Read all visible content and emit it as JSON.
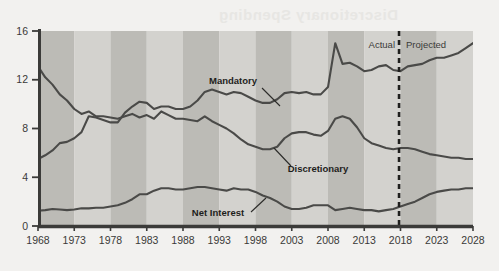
{
  "chart_data": {
    "type": "line",
    "title": "",
    "xlabel": "",
    "ylabel": "",
    "xlim": [
      1968,
      2028
    ],
    "ylim": [
      0,
      16
    ],
    "yticks": [
      0,
      4,
      8,
      12,
      16
    ],
    "xticks": [
      1968,
      1973,
      1978,
      1983,
      1988,
      1993,
      1998,
      2003,
      2008,
      2013,
      2018,
      2023,
      2028
    ],
    "grid": false,
    "legend": "inline-annotations",
    "band_shading": "alternating 5-year vertical bands",
    "annotations": [
      {
        "name": "actual-label",
        "text": "Actual",
        "x": 2014.5,
        "y": 14.6
      },
      {
        "name": "projected-label",
        "text": "Projected",
        "x": 2021.5,
        "y": 14.6
      },
      {
        "name": "divider",
        "text": "",
        "x": 2017.8,
        "style": "dashed-vertical"
      }
    ],
    "series": [
      {
        "name": "Mandatory",
        "label": "Mandatory",
        "label_x": 1993.5,
        "label_y": 12.4,
        "color": "#4a4a48",
        "x": [
          1968,
          1969,
          1970,
          1971,
          1972,
          1973,
          1974,
          1975,
          1976,
          1977,
          1978,
          1979,
          1980,
          1981,
          1982,
          1983,
          1984,
          1985,
          1986,
          1987,
          1988,
          1989,
          1990,
          1991,
          1992,
          1993,
          1994,
          1995,
          1996,
          1997,
          1998,
          1999,
          2000,
          2001,
          2002,
          2003,
          2004,
          2005,
          2006,
          2007,
          2008,
          2009,
          2010,
          2011,
          2012,
          2013,
          2014,
          2015,
          2016,
          2017,
          2018,
          2019,
          2020,
          2021,
          2022,
          2023,
          2024,
          2025,
          2026,
          2027,
          2028
        ],
        "values": [
          5.5,
          5.8,
          6.2,
          6.8,
          6.9,
          7.2,
          7.7,
          9.0,
          8.9,
          8.7,
          8.5,
          8.5,
          9.3,
          9.8,
          10.2,
          10.1,
          9.6,
          9.8,
          9.8,
          9.6,
          9.6,
          9.8,
          10.3,
          11.0,
          11.2,
          11.0,
          10.8,
          11.0,
          10.9,
          10.6,
          10.3,
          10.1,
          10.1,
          10.4,
          10.9,
          11.0,
          10.9,
          11.0,
          10.8,
          10.8,
          11.4,
          15.0,
          13.3,
          13.4,
          13.1,
          12.7,
          12.8,
          13.1,
          13.2,
          12.8,
          12.7,
          13.1,
          13.2,
          13.3,
          13.6,
          13.8,
          13.8,
          14.0,
          14.2,
          14.6,
          15.0
        ]
      },
      {
        "name": "Discretionary",
        "label": "Discretionary",
        "label_x": 2002.0,
        "label_y": 5.5,
        "color": "#4a4a48",
        "x": [
          1968,
          1969,
          1970,
          1971,
          1972,
          1973,
          1974,
          1975,
          1976,
          1977,
          1978,
          1979,
          1980,
          1981,
          1982,
          1983,
          1984,
          1985,
          1986,
          1987,
          1988,
          1989,
          1990,
          1991,
          1992,
          1993,
          1994,
          1995,
          1996,
          1997,
          1998,
          1999,
          2000,
          2001,
          2002,
          2003,
          2004,
          2005,
          2006,
          2007,
          2008,
          2009,
          2010,
          2011,
          2012,
          2013,
          2014,
          2015,
          2016,
          2017,
          2018,
          2019,
          2020,
          2021,
          2022,
          2023,
          2024,
          2025,
          2026,
          2027,
          2028
        ],
        "values": [
          13.1,
          12.2,
          11.6,
          10.8,
          10.3,
          9.6,
          9.2,
          9.4,
          9.0,
          9.0,
          8.9,
          8.8,
          9.0,
          9.2,
          8.9,
          9.1,
          8.8,
          9.4,
          9.1,
          8.8,
          8.8,
          8.7,
          8.6,
          9.0,
          8.6,
          8.3,
          8.0,
          7.6,
          7.1,
          6.7,
          6.5,
          6.3,
          6.3,
          6.5,
          7.2,
          7.6,
          7.7,
          7.7,
          7.5,
          7.4,
          7.8,
          8.8,
          9.0,
          8.8,
          8.1,
          7.2,
          6.8,
          6.6,
          6.4,
          6.3,
          6.4,
          6.4,
          6.3,
          6.1,
          5.9,
          5.8,
          5.7,
          5.6,
          5.6,
          5.5,
          5.5
        ]
      },
      {
        "name": "Net Interest",
        "label": "Net Interest",
        "label_x": 1991.0,
        "label_y": 1.6,
        "color": "#4a4a48",
        "x": [
          1968,
          1969,
          1970,
          1971,
          1972,
          1973,
          1974,
          1975,
          1976,
          1977,
          1978,
          1979,
          1980,
          1981,
          1982,
          1983,
          1984,
          1985,
          1986,
          1987,
          1988,
          1989,
          1990,
          1991,
          1992,
          1993,
          1994,
          1995,
          1996,
          1997,
          1998,
          1999,
          2000,
          2001,
          2002,
          2003,
          2004,
          2005,
          2006,
          2007,
          2008,
          2009,
          2010,
          2011,
          2012,
          2013,
          2014,
          2015,
          2016,
          2017,
          2018,
          2019,
          2020,
          2021,
          2022,
          2023,
          2024,
          2025,
          2026,
          2027,
          2028
        ],
        "values": [
          1.25,
          1.3,
          1.4,
          1.35,
          1.3,
          1.35,
          1.45,
          1.45,
          1.5,
          1.5,
          1.6,
          1.7,
          1.9,
          2.2,
          2.6,
          2.6,
          2.9,
          3.1,
          3.1,
          3.0,
          3.0,
          3.1,
          3.2,
          3.2,
          3.1,
          3.0,
          2.9,
          3.1,
          3.0,
          3.0,
          2.8,
          2.5,
          2.3,
          2.0,
          1.6,
          1.4,
          1.4,
          1.5,
          1.7,
          1.7,
          1.7,
          1.3,
          1.4,
          1.5,
          1.4,
          1.3,
          1.3,
          1.2,
          1.3,
          1.4,
          1.6,
          1.8,
          2.0,
          2.3,
          2.6,
          2.8,
          2.9,
          3.0,
          3.0,
          3.1,
          3.1
        ]
      }
    ]
  },
  "axes": {
    "y_labels": [
      "16",
      "12",
      "8",
      "4",
      "0"
    ],
    "x_labels": [
      "1968",
      "1973",
      "1978",
      "1983",
      "1988",
      "1993",
      "1998",
      "2003",
      "2008",
      "2013",
      "2018",
      "2023",
      "2028"
    ]
  },
  "labels": {
    "mandatory": "Mandatory",
    "discretionary": "Discretionary",
    "net_interest": "Net Interest",
    "actual": "Actual",
    "projected": "Projected"
  },
  "colors": {
    "page_background": "#f2f1ef",
    "band_light": "#d3d2ce",
    "band_dark": "#bcbbb6",
    "line": "#4a4a48",
    "axis": "#3b3b39",
    "text": "#2b2b29"
  },
  "bleed_text": "Discretionary Spending"
}
